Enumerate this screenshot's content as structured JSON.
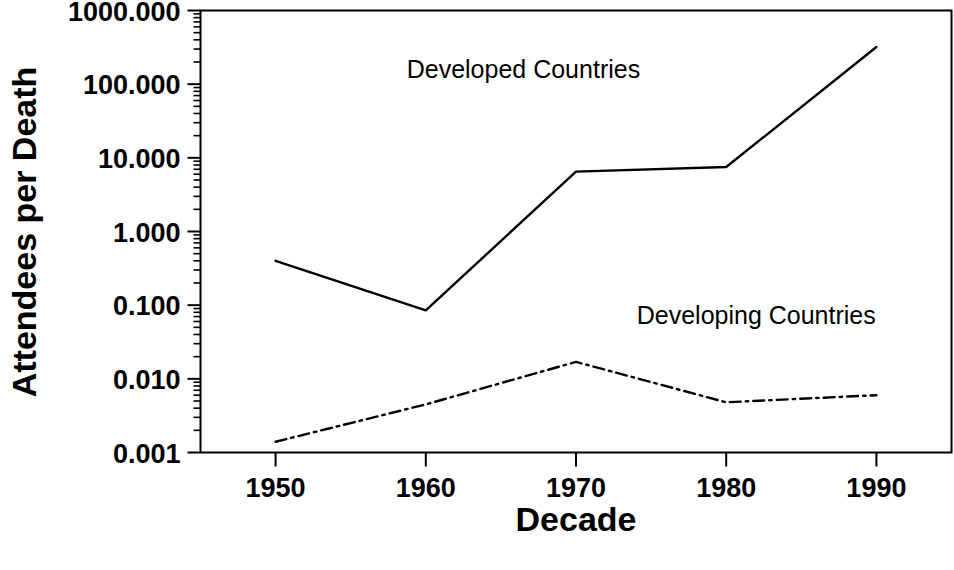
{
  "chart_data": {
    "type": "line",
    "title": "",
    "xlabel": "Decade",
    "ylabel": "Attendees per Death",
    "x": [
      1950,
      1960,
      1970,
      1980,
      1990
    ],
    "xtick_labels": [
      "1950",
      "1960",
      "1970",
      "1980",
      "1990"
    ],
    "xlim": [
      1945,
      1995
    ],
    "yscale": "log",
    "ylim": [
      0.001,
      1000.0
    ],
    "ytick_labels": [
      "0.001",
      "0.010",
      "0.100",
      "1.000",
      "10.000",
      "100.000",
      "1000.000"
    ],
    "ytick_values": [
      0.001,
      0.01,
      0.1,
      1.0,
      10.0,
      100.0,
      1000.0
    ],
    "grid": false,
    "legend_position": "inline-annotations",
    "minor_ticks": true,
    "series": [
      {
        "name": "Developed Countries",
        "style": "solid",
        "color": "#000000",
        "values": [
          0.4,
          0.085,
          6.5,
          7.5,
          320.0
        ]
      },
      {
        "name": "Developing Countries",
        "style": "dash-dot",
        "color": "#000000",
        "values": [
          0.0014,
          0.0045,
          0.017,
          0.0048,
          0.006
        ]
      }
    ],
    "annotations": [
      {
        "text": "Developed Countries",
        "x": 1966.5,
        "y": 120.0
      },
      {
        "text": "Developing Countries",
        "x": 1982.0,
        "y": 0.055
      }
    ]
  }
}
